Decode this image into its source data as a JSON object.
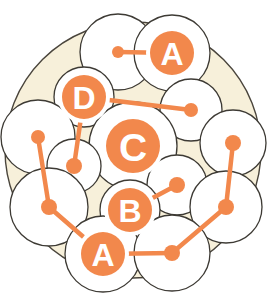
{
  "diagram": {
    "canvas": {
      "width": 275,
      "height": 299
    },
    "colors": {
      "background": "#ffffff",
      "field_fill": "#f7f0da",
      "field_stroke": "#4a453c",
      "circle_fill": "#ffffff",
      "circle_stroke": "#3d3a34",
      "accent": "#f2884c",
      "accent_light": "#f5a06a",
      "label_text": "#ffffff"
    },
    "field": {
      "name": "outer-boundary-circle",
      "cx": 133,
      "cy": 150,
      "r": 128
    },
    "circles": [
      {
        "id": "c1",
        "cx": 118,
        "cy": 52,
        "r": 38
      },
      {
        "id": "c2",
        "cx": 172,
        "cy": 53,
        "r": 38
      },
      {
        "id": "c3",
        "cx": 84,
        "cy": 97,
        "r": 30
      },
      {
        "id": "c4",
        "cx": 191,
        "cy": 110,
        "r": 31
      },
      {
        "id": "c5",
        "cx": 133,
        "cy": 146,
        "r": 44
      },
      {
        "id": "c6",
        "cx": 38,
        "cy": 137,
        "r": 37
      },
      {
        "id": "c7",
        "cx": 74,
        "cy": 166,
        "r": 27
      },
      {
        "id": "c8",
        "cx": 233,
        "cy": 143,
        "r": 33
      },
      {
        "id": "c9",
        "cx": 177,
        "cy": 185,
        "r": 30
      },
      {
        "id": "c10",
        "cx": 49,
        "cy": 207,
        "r": 39
      },
      {
        "id": "c11",
        "cx": 130,
        "cy": 210,
        "r": 30
      },
      {
        "id": "c12",
        "cx": 226,
        "cy": 207,
        "r": 36
      },
      {
        "id": "c13",
        "cx": 103,
        "cy": 254,
        "r": 38
      },
      {
        "id": "c14",
        "cx": 172,
        "cy": 253,
        "r": 38
      }
    ],
    "nodes": [
      {
        "id": "n1",
        "label": "",
        "cx": 118,
        "cy": 52,
        "r": 6,
        "type": "dot"
      },
      {
        "id": "n2",
        "label": "A",
        "cx": 172,
        "cy": 53,
        "r": 22,
        "type": "labeled"
      },
      {
        "id": "n3",
        "label": "D",
        "cx": 84,
        "cy": 97,
        "r": 22,
        "type": "labeled"
      },
      {
        "id": "n4",
        "label": "",
        "cx": 191,
        "cy": 110,
        "r": 7,
        "type": "dot"
      },
      {
        "id": "n5",
        "label": "C",
        "cx": 133,
        "cy": 146,
        "r": 27,
        "type": "labeled"
      },
      {
        "id": "n6",
        "label": "",
        "cx": 38,
        "cy": 137,
        "r": 7,
        "type": "dot"
      },
      {
        "id": "n7",
        "label": "",
        "cx": 74,
        "cy": 166,
        "r": 8,
        "type": "dot"
      },
      {
        "id": "n8",
        "label": "",
        "cx": 233,
        "cy": 143,
        "r": 8,
        "type": "dot"
      },
      {
        "id": "n9",
        "label": "",
        "cx": 177,
        "cy": 185,
        "r": 8,
        "type": "dot"
      },
      {
        "id": "n10",
        "label": "",
        "cx": 49,
        "cy": 207,
        "r": 8,
        "type": "dot"
      },
      {
        "id": "n11",
        "label": "B",
        "cx": 130,
        "cy": 210,
        "r": 22,
        "type": "labeled"
      },
      {
        "id": "n12",
        "label": "",
        "cx": 226,
        "cy": 207,
        "r": 8,
        "type": "dot"
      },
      {
        "id": "n13",
        "label": "A",
        "cx": 103,
        "cy": 254,
        "r": 22,
        "type": "labeled"
      },
      {
        "id": "n14",
        "label": "",
        "cx": 172,
        "cy": 253,
        "r": 8,
        "type": "dot"
      }
    ],
    "edges": [
      {
        "id": "e1",
        "from": "n1",
        "to": "n2",
        "x1": 118,
        "y1": 52,
        "x2": 172,
        "y2": 53
      },
      {
        "id": "e2",
        "from": "n3",
        "to": "n4",
        "x1": 84,
        "y1": 97,
        "x2": 191,
        "y2": 110
      },
      {
        "id": "e3",
        "from": "n3",
        "to": "n7",
        "x1": 84,
        "y1": 97,
        "x2": 74,
        "y2": 166
      },
      {
        "id": "e4",
        "from": "n6",
        "to": "n10",
        "x1": 38,
        "y1": 137,
        "x2": 49,
        "y2": 207
      },
      {
        "id": "e5",
        "from": "n10",
        "to": "n13",
        "x1": 49,
        "y1": 207,
        "x2": 103,
        "y2": 254
      },
      {
        "id": "e6",
        "from": "n11",
        "to": "n9",
        "x1": 130,
        "y1": 210,
        "x2": 177,
        "y2": 185
      },
      {
        "id": "e7",
        "from": "n8",
        "to": "n12",
        "x1": 233,
        "y1": 143,
        "x2": 226,
        "y2": 207
      },
      {
        "id": "e8",
        "from": "n12",
        "to": "n14",
        "x1": 226,
        "y1": 207,
        "x2": 172,
        "y2": 253
      },
      {
        "id": "e9",
        "from": "n13",
        "to": "n14",
        "x1": 103,
        "y1": 254,
        "x2": 172,
        "y2": 253
      }
    ],
    "legend_labels": [
      "A",
      "B",
      "C",
      "D"
    ]
  }
}
